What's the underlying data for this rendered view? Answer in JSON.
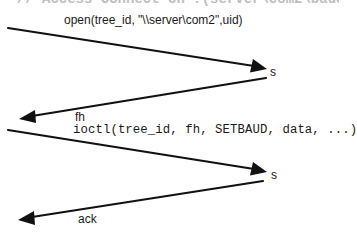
{
  "diagram": {
    "type": "message-sequence",
    "clipped_header": "  // Access Connect on ?(server\\com2\\baud),",
    "messages": [
      {
        "direction": "client-to-server",
        "label": "open(tree_id, \"\\\\server\\com2\",uid)",
        "font": "sans",
        "endpoint_label": "s"
      },
      {
        "direction": "server-to-client",
        "label": "fh",
        "font": "sans"
      },
      {
        "direction": "client-to-server",
        "label": "ioctl(tree_id, fh, SETBAUD, data, ...)",
        "font": "mono",
        "endpoint_label": "s"
      },
      {
        "direction": "server-to-client",
        "label": "ack",
        "font": "sans"
      }
    ]
  },
  "colors": {
    "line": "#111111",
    "text": "#1a1a1a",
    "background": "#ffffff"
  }
}
